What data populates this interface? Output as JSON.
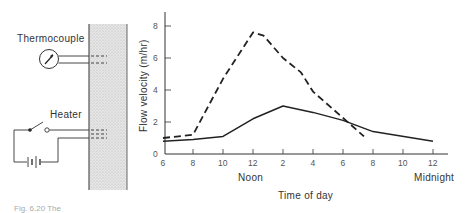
{
  "diagram": {
    "thermocouple_label": "Thermocouple",
    "heater_label": "Heater",
    "caption_partial": "Fig. 6.20 The"
  },
  "chart_data": {
    "type": "line",
    "title": "",
    "xlabel": "Time of day",
    "ylabel": "Flow velocity (m/hr)",
    "x_tick_labels": [
      "6",
      "8",
      "10",
      "12",
      "2",
      "4",
      "6",
      "8",
      "10",
      "12"
    ],
    "x_sub_labels": {
      "noon": "Noon",
      "midnight": "Midnight"
    },
    "y_tick_labels": [
      "0",
      "2",
      "4",
      "6",
      "8"
    ],
    "ylim": [
      0,
      8
    ],
    "x_hours": [
      6,
      8,
      10,
      12,
      14,
      16,
      18,
      20,
      22,
      24
    ],
    "series": [
      {
        "name": "dashed",
        "style": "dashed",
        "x": [
          6,
          8,
          10,
          12,
          12.7,
          14,
          15.2,
          16,
          19.4
        ],
        "values": [
          1.0,
          1.2,
          4.7,
          7.6,
          7.4,
          6.0,
          5.1,
          3.9,
          1.1
        ]
      },
      {
        "name": "solid",
        "style": "solid",
        "x": [
          6,
          8,
          10,
          12,
          14,
          16,
          18,
          20,
          24
        ],
        "values": [
          0.8,
          0.9,
          1.1,
          2.2,
          3.0,
          2.6,
          2.1,
          1.4,
          0.8
        ]
      }
    ],
    "grid": false,
    "legend": "none"
  }
}
